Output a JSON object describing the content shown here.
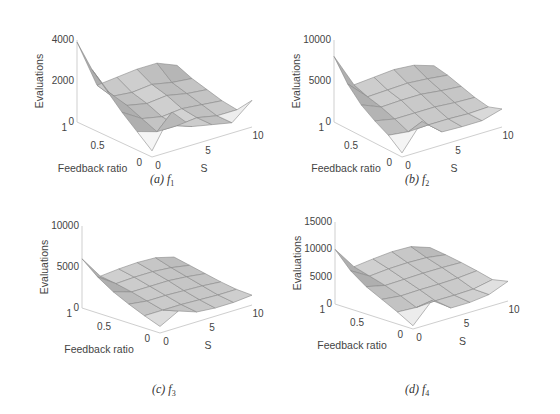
{
  "figure": {
    "panels": [
      {
        "id": "a",
        "caption_prefix": "(a)",
        "caption_fn": "f",
        "caption_sub": "1"
      },
      {
        "id": "b",
        "caption_prefix": "(b)",
        "caption_fn": "f",
        "caption_sub": "2"
      },
      {
        "id": "c",
        "caption_prefix": "(c)",
        "caption_fn": "f",
        "caption_sub": "3"
      },
      {
        "id": "d",
        "caption_prefix": "(d)",
        "caption_fn": "f",
        "caption_sub": "4"
      }
    ]
  },
  "chart_data": [
    {
      "type": "surface",
      "title": "(a) f1",
      "xlabel": "S",
      "ylabel": "Feedback ratio",
      "zlabel": "Evaluations",
      "xticks": [
        "0",
        "5",
        "10"
      ],
      "yticks": [
        "0",
        "0.5",
        "1"
      ],
      "zticks": [
        "0",
        "2000",
        "4000"
      ],
      "xlim": [
        0,
        10
      ],
      "ylim": [
        0,
        1
      ],
      "zlim": [
        0,
        4000
      ],
      "grid": false,
      "x": [
        0,
        2,
        4,
        6,
        8,
        10
      ],
      "y": [
        0,
        0.2,
        0.4,
        0.6,
        0.8,
        1.0
      ],
      "z": [
        [
          300,
          1900,
          900,
          700,
          500,
          1300
        ],
        [
          900,
          600,
          600,
          700,
          500,
          500
        ],
        [
          1500,
          900,
          700,
          800,
          700,
          600
        ],
        [
          2200,
          1200,
          1000,
          1100,
          900,
          800
        ],
        [
          2900,
          1300,
          1200,
          1300,
          1100,
          1000
        ],
        [
          3900,
          1500,
          1600,
          1700,
          1700,
          1300
        ]
      ]
    },
    {
      "type": "surface",
      "title": "(b) f2",
      "xlabel": "S",
      "ylabel": "Feedback ratio",
      "zlabel": "Evaluations",
      "xticks": [
        "0",
        "5",
        "10"
      ],
      "yticks": [
        "0",
        "0.5",
        "1"
      ],
      "zticks": [
        "0",
        "5000",
        "10000"
      ],
      "xlim": [
        0,
        10
      ],
      "ylim": [
        0,
        1
      ],
      "zlim": [
        0,
        10000
      ],
      "grid": false,
      "x": [
        0,
        2,
        4,
        6,
        8,
        10
      ],
      "y": [
        0,
        0.2,
        0.4,
        0.6,
        0.8,
        1.0
      ],
      "z": [
        [
          500,
          3600,
          1600,
          1500,
          1500,
          2200
        ],
        [
          1800,
          1500,
          1600,
          1600,
          1500,
          1600
        ],
        [
          2700,
          2200,
          2200,
          2200,
          2000,
          1900
        ],
        [
          3800,
          2800,
          2900,
          2900,
          2600,
          2400
        ],
        [
          5500,
          3200,
          3300,
          3400,
          3200,
          2900
        ],
        [
          8000,
          3800,
          4000,
          4200,
          4000,
          3200
        ]
      ]
    },
    {
      "type": "surface",
      "title": "(c) f3",
      "xlabel": "S",
      "ylabel": "Feedback ratio",
      "zlabel": "Evaluations",
      "xticks": [
        "0",
        "5",
        "10"
      ],
      "yticks": [
        "0",
        "0.5",
        "1"
      ],
      "zticks": [
        "0",
        "5000",
        "10000"
      ],
      "xlim": [
        0,
        10
      ],
      "ylim": [
        0,
        1
      ],
      "zlim": [
        0,
        10000
      ],
      "grid": false,
      "x": [
        0,
        2,
        4,
        6,
        8,
        10
      ],
      "y": [
        0,
        0.2,
        0.4,
        0.6,
        0.8,
        1.0
      ],
      "z": [
        [
          800,
          2000,
          1200,
          1000,
          1000,
          1200
        ],
        [
          1500,
          1500,
          1500,
          1400,
          1300,
          1300
        ],
        [
          2300,
          2000,
          2000,
          1900,
          1800,
          1600
        ],
        [
          3200,
          2500,
          2500,
          2500,
          2300,
          2000
        ],
        [
          4400,
          2900,
          3000,
          3000,
          2800,
          2400
        ],
        [
          6000,
          3200,
          3400,
          3500,
          3400,
          2800
        ]
      ]
    },
    {
      "type": "surface",
      "title": "(d) f4",
      "xlabel": "S",
      "ylabel": "Feedback ratio",
      "zlabel": "Evaluations",
      "xticks": [
        "0",
        "5",
        "10"
      ],
      "yticks": [
        "0",
        "0.5",
        "1"
      ],
      "zticks": [
        "0",
        "5000",
        "10000",
        "15000"
      ],
      "xlim": [
        0,
        10
      ],
      "ylim": [
        0,
        1
      ],
      "zlim": [
        0,
        15000
      ],
      "grid": false,
      "x": [
        0,
        2,
        4,
        6,
        8,
        10
      ],
      "y": [
        0,
        0.2,
        0.4,
        0.6,
        0.8,
        1.0
      ],
      "z": [
        [
          600,
          4200,
          1800,
          1800,
          2200,
          3600
        ],
        [
          2200,
          2000,
          2200,
          2200,
          2300,
          3000
        ],
        [
          3600,
          3200,
          3300,
          3300,
          3400,
          3700
        ],
        [
          5000,
          4200,
          4300,
          4400,
          4400,
          4300
        ],
        [
          7000,
          5000,
          5300,
          5400,
          5300,
          4800
        ],
        [
          10000,
          5800,
          6200,
          6500,
          6400,
          5200
        ]
      ]
    }
  ]
}
